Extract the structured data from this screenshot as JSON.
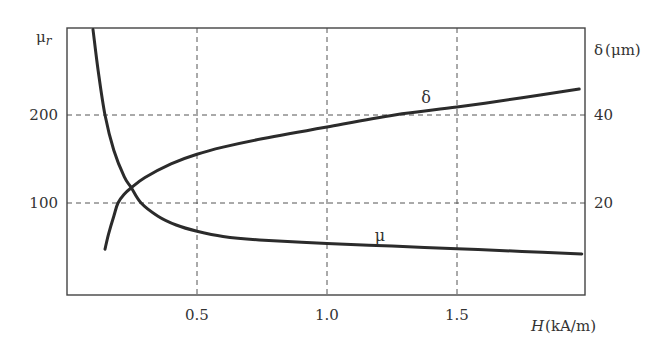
{
  "chart_data": {
    "type": "line",
    "title": "",
    "xlabel": "H (kA/m)",
    "xlabel_parts": {
      "var": "H",
      "unit": "(kA/m)"
    },
    "ylabel_left": "μr",
    "ylabel_left_parts": {
      "main": "μ",
      "sub": "r"
    },
    "ylabel_right": "δ (μm)",
    "ylabel_right_parts": {
      "main": "δ",
      "unit": "(μm)"
    },
    "xlim": [
      0,
      2.0
    ],
    "ylim_left": [
      0,
      300
    ],
    "ylim_right": [
      0,
      46
    ],
    "x_ticks": [
      "0.5",
      "1.0",
      "1.5"
    ],
    "x_tick_values": [
      0.5,
      1.0,
      1.5
    ],
    "y_left_ticks": [
      "100",
      "200"
    ],
    "y_left_tick_values": [
      100,
      200
    ],
    "y_right_ticks": [
      "20",
      "40"
    ],
    "y_right_tick_values": [
      20,
      40
    ],
    "grid": "dashed, at tick positions",
    "legend": "none (curves labeled inline)",
    "series": [
      {
        "name": "μ",
        "axis": "left",
        "label": "μ",
        "x": [
          0.1,
          0.12,
          0.146,
          0.18,
          0.22,
          0.246,
          0.285,
          0.35,
          0.42,
          0.5,
          0.6,
          0.74,
          1.0,
          1.25,
          1.5,
          1.75,
          1.98
        ],
        "values": [
          297,
          250,
          200,
          160,
          130,
          118,
          100,
          85,
          75,
          68,
          62,
          58,
          54,
          51,
          48,
          45,
          42
        ]
      },
      {
        "name": "δ",
        "axis": "right",
        "label": "δ",
        "x": [
          0.146,
          0.16,
          0.18,
          0.196,
          0.22,
          0.246,
          0.3,
          0.4,
          0.5,
          0.6,
          0.75,
          1.0,
          1.26,
          1.5,
          1.75,
          1.97
        ],
        "values": [
          9.5,
          13,
          17,
          20,
          22,
          23.4,
          25.8,
          28.9,
          31.1,
          32.7,
          34.6,
          37.3,
          40,
          41.8,
          43.9,
          45.9
        ]
      }
    ]
  }
}
